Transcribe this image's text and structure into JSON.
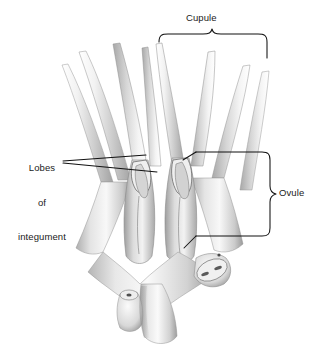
{
  "figure": {
    "background_color": "#ffffff",
    "line_color": "#1a1a1a",
    "illustration_style": "grayscale shaded botanical drawing"
  },
  "labels": {
    "cupule": "Cupule",
    "ovule": "Ovule",
    "lobes_line1": "Lobes",
    "lobes_line2": "of",
    "lobes_line3": "integument"
  },
  "annotations": {
    "cupule_bracket": "curly-brace-horizontal",
    "ovule_bracket": "curly-brace-vertical",
    "lobes_leaders": "two-leader-lines"
  }
}
